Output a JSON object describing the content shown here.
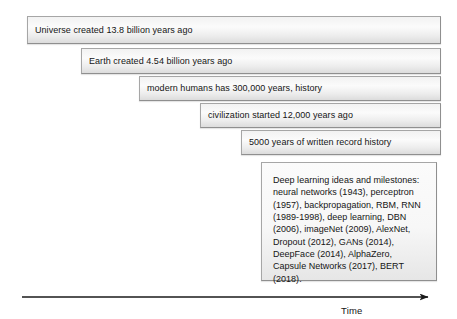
{
  "figure": {
    "type": "timeline-diagram",
    "background": "#ffffff",
    "bar_fill": "#f2f2f2",
    "bar_border": "#a6a6a6",
    "text_color": "#151515"
  },
  "bars": [
    {
      "label": "Universe created 13.8 billion years ago",
      "x": 27,
      "y": 16,
      "width": 414,
      "height": 28
    },
    {
      "label": "Earth created 4.54 billion years ago",
      "x": 81,
      "y": 48,
      "width": 360,
      "height": 26
    },
    {
      "label": "modern humans has 300,000 years, history",
      "x": 139,
      "y": 76,
      "width": 302,
      "height": 25
    },
    {
      "label": "civilization started 12,000 years ago",
      "x": 200,
      "y": 103,
      "width": 241,
      "height": 25
    },
    {
      "label": "5000 years of written record history",
      "x": 241,
      "y": 130,
      "width": 200,
      "height": 25
    }
  ],
  "note": {
    "x": 261,
    "y": 162,
    "width": 176,
    "height": 119,
    "text": "Deep learning ideas and milestones: neural networks (1943), perceptron (1957), backpropagation, RBM, RNN (1989-1998), deep learning, DBN (2006), imageNet (2009), AlexNet, Dropout (2012), GANs (2014), DeepFace (2014), AlphaZero, Capsule Networks (2017), BERT (2018)."
  },
  "axis": {
    "label": "Time",
    "label_x": 341,
    "label_y": 305,
    "line_y": 297,
    "line_x_start": 22,
    "line_x_end": 433,
    "color": "#1a1a1a"
  }
}
